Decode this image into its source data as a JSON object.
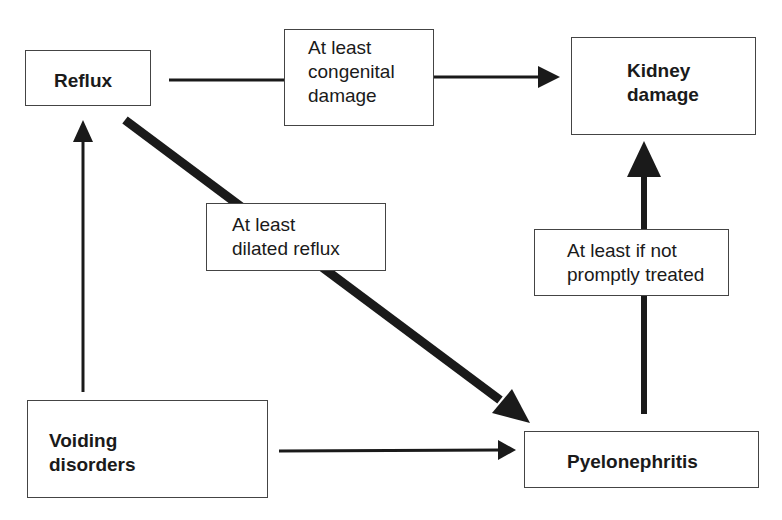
{
  "diagram": {
    "type": "flowchart",
    "nodes": {
      "reflux": {
        "lines": [
          "Reflux"
        ]
      },
      "kidney_damage": {
        "lines": [
          "Kidney",
          "damage"
        ]
      },
      "voiding_disorders": {
        "lines": [
          "Voiding",
          "disorders"
        ]
      },
      "pyelonephritis": {
        "lines": [
          "Pyelonephritis"
        ]
      }
    },
    "edge_labels": {
      "congenital": {
        "lines": [
          "At least",
          "congenital",
          "damage"
        ]
      },
      "dilated": {
        "lines": [
          "At least",
          "dilated reflux"
        ]
      },
      "treated": {
        "lines": [
          "At least if not",
          "promptly treated"
        ]
      }
    },
    "edges": [
      {
        "from": "Reflux",
        "to": "Kidney damage",
        "label": "At least congenital damage",
        "weight": "thin"
      },
      {
        "from": "Reflux",
        "to": "Pyelonephritis",
        "label": "At least dilated reflux",
        "weight": "thick"
      },
      {
        "from": "Voiding disorders",
        "to": "Reflux",
        "label": "",
        "weight": "thin"
      },
      {
        "from": "Voiding disorders",
        "to": "Pyelonephritis",
        "label": "",
        "weight": "thin"
      },
      {
        "from": "Pyelonephritis",
        "to": "Kidney damage",
        "label": "At least if not promptly treated",
        "weight": "thick"
      }
    ],
    "colors": {
      "stroke": "#1a1a1a",
      "border": "#444444",
      "background": "#ffffff"
    }
  }
}
